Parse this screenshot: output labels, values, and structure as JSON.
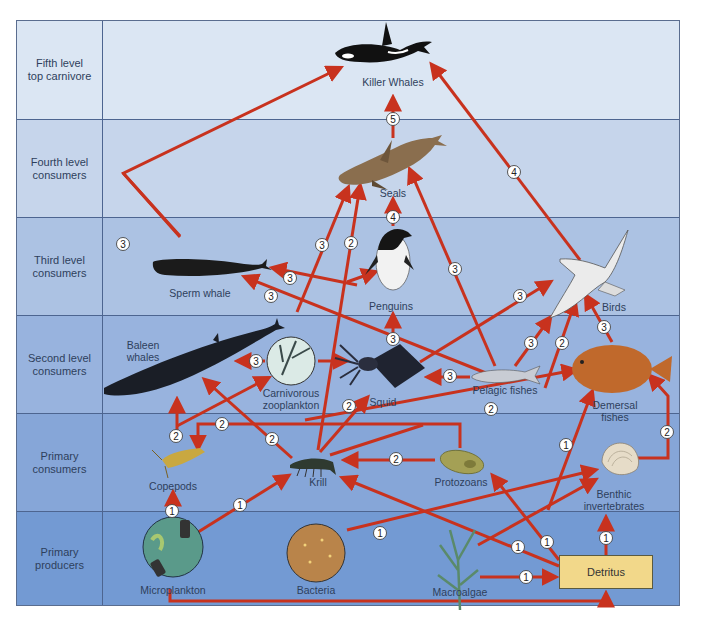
{
  "levels": [
    {
      "label": "Fifth level\ntop carnivore",
      "color": "#dbe6f3"
    },
    {
      "label": "Fourth level\nconsumers",
      "color": "#c6d5eb"
    },
    {
      "label": "Third level\nconsumers",
      "color": "#acc2e3"
    },
    {
      "label": "Second level\nconsumers",
      "color": "#98b3de"
    },
    {
      "label": "Primary\nconsumers",
      "color": "#86a6d8"
    },
    {
      "label": "Primary\nproducers",
      "color": "#739ad3"
    }
  ],
  "organisms": {
    "killer_whales": "Killer Whales",
    "seals": "Seals",
    "penguins": "Penguins",
    "sperm_whale": "Sperm whale",
    "birds": "Birds",
    "baleen_whales_1": "Baleen",
    "baleen_whales_2": "whales",
    "carnivorous_zooplankton_1": "Carnivorous",
    "carnivorous_zooplankton_2": "zooplankton",
    "squid": "Squid",
    "pelagic_fishes": "Pelagic fishes",
    "demersal_fishes_1": "Demersal",
    "demersal_fishes_2": "fishes",
    "copepods": "Copepods",
    "krill": "Krill",
    "protozoans": "Protozoans",
    "benthic_invertebrates_1": "Benthic",
    "benthic_invertebrates_2": "invertebrates",
    "microplankton": "Microplankton",
    "bacteria": "Bacteria",
    "macroalgae": "Macroalgae",
    "detritus": "Detritus"
  },
  "colors": {
    "arrow": "#c8321e",
    "detritus_fill": "#f2d88a",
    "border": "#4d6590"
  },
  "trophic_markers": {
    "m5_killer": "5",
    "m4_seals": "4",
    "m4_birds_killer": "4",
    "m3_baleen_killer": "3",
    "m3_seal_a": "3",
    "m2_seal_b": "2",
    "m3_seal_c": "3",
    "m3_sperm_a": "3",
    "m3_sperm_b": "3",
    "m3_penguin_squid": "3",
    "m3_birds_squid": "3",
    "m3_carn_baleen": "3",
    "m3_pelagic_squid": "3",
    "m3_pelagic_birds": "3",
    "m2_birds_krill": "2",
    "m3_demersal_birds": "3",
    "m2_squid_krill": "2",
    "m2_krill_baleen": "2",
    "m2_copepod_up": "2",
    "m2_copepod_feed": "2",
    "m2_protozoa_demersal": "2",
    "m2_protozoa_krill": "2",
    "m2_benthic_demersal": "2",
    "m1_micro_copepod": "1",
    "m1_micro_krill": "1",
    "m1_bacteria": "1",
    "m1_detritus_benthic": "1",
    "m1_macro_detritus": "1",
    "m1_detritus_krill": "1",
    "m1_detritus_protozoa": "1",
    "m1_demersal_detritus": "1"
  }
}
